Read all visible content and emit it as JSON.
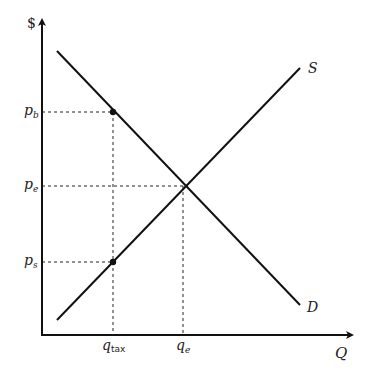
{
  "diagram": {
    "axes": {
      "y_label": "$",
      "x_label": "Q"
    },
    "curves": {
      "supply_label": "S",
      "demand_label": "D"
    },
    "price_labels": {
      "pb": {
        "base": "p",
        "sub": "b"
      },
      "pe": {
        "base": "p",
        "sub": "e"
      },
      "ps": {
        "base": "p",
        "sub": "s"
      }
    },
    "quantity_labels": {
      "qtax": {
        "base": "q",
        "sub": "tax"
      },
      "qe": {
        "base": "q",
        "sub": "e"
      }
    },
    "colors": {
      "line": "#111111",
      "text": "#222222",
      "background": "#ffffff"
    }
  }
}
